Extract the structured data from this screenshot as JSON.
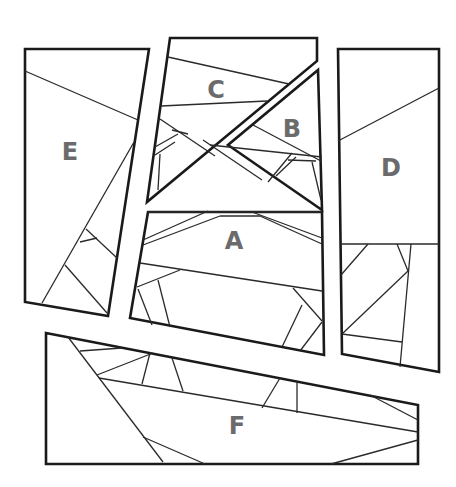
{
  "diagram": {
    "pieces": [
      {
        "id": "A",
        "label": "A",
        "x": 234,
        "y": 242
      },
      {
        "id": "B",
        "label": "B",
        "x": 292,
        "y": 130
      },
      {
        "id": "C",
        "label": "C",
        "x": 216,
        "y": 91
      },
      {
        "id": "D",
        "label": "D",
        "x": 391,
        "y": 169
      },
      {
        "id": "E",
        "label": "E",
        "x": 70,
        "y": 153
      },
      {
        "id": "F",
        "label": "F",
        "x": 237,
        "y": 427
      }
    ],
    "colors": {
      "stroke": "#1a1a1a",
      "label": "#6b6b6b",
      "background": "#ffffff"
    }
  }
}
